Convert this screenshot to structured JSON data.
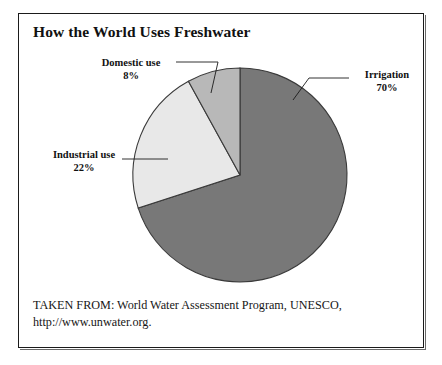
{
  "figure": {
    "title": "How the World Uses Freshwater",
    "caption_line_1": "TAKEN FROM: World Water Assessment Program, UNESCO,",
    "caption_line_2": "http://www.unwater.org."
  },
  "labels": {
    "irrigation": {
      "name": "Irrigation",
      "percent": "70%"
    },
    "industrial": {
      "name": "Industrial use",
      "percent": "22%"
    },
    "domestic": {
      "name": "Domestic use",
      "percent": "8%"
    }
  },
  "colors": {
    "irrigation": "#787878",
    "industrial": "#e8e8e8",
    "domestic": "#b8b8b8",
    "outline": "#3a3a3a",
    "frame": "#1b1b1b",
    "text": "#111111",
    "background": "#ffffff"
  },
  "chart_data": {
    "type": "pie",
    "title": "How the World Uses Freshwater",
    "categories": [
      "Irrigation",
      "Industrial use",
      "Domestic use"
    ],
    "values": [
      70,
      22,
      8
    ],
    "unit": "%",
    "labels": [
      "70%",
      "22%",
      "8%"
    ],
    "colors": [
      "#787878",
      "#e8e8e8",
      "#b8b8b8"
    ],
    "start_angle_deg": 0,
    "direction": "clockwise",
    "center": [
      240,
      175
    ],
    "radius": 107,
    "legend": "none",
    "annotations": [
      "TAKEN FROM: World Water Assessment Program, UNESCO,",
      "http://www.unwater.org."
    ]
  }
}
